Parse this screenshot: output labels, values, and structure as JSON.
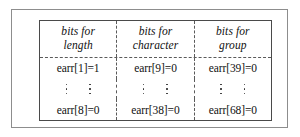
{
  "figure": {
    "caption_present": false,
    "colors": {
      "outer_frame": "#8d8d8d",
      "table_border": "#4a4a4a",
      "separator": "#5a5a5a",
      "text": "#111111",
      "background": "#ffffff"
    }
  },
  "table": {
    "headers": [
      {
        "line1": "bits for",
        "line2": "length"
      },
      {
        "line1": "bits for",
        "line2": "character"
      },
      {
        "line1": "bits for",
        "line2": "group"
      }
    ],
    "rows": [
      {
        "type": "values",
        "cells": [
          "earr[1]=1",
          "earr[9]=0",
          "earr[39]=0"
        ]
      },
      {
        "type": "ellipsis",
        "cells": [
          "",
          "",
          ""
        ]
      },
      {
        "type": "values",
        "cells": [
          "earr[8]=0",
          "earr[38]=0",
          "earr[68]=0"
        ]
      }
    ]
  }
}
